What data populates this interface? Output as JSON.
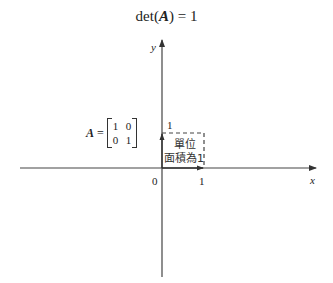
{
  "title": {
    "prefix": "det(",
    "symbol": "A",
    "suffix": ") = 1"
  },
  "axes": {
    "x_label": "x",
    "y_label": "y",
    "origin_label": "0",
    "x_tick_label": "1",
    "y_tick_label": "1"
  },
  "matrix": {
    "name": "A",
    "equals": "=",
    "rows": [
      [
        "1",
        "0"
      ],
      [
        "0",
        "1"
      ]
    ]
  },
  "annotation": {
    "line1": "單位",
    "line2": "面積為1"
  },
  "colors": {
    "axis": "#444444",
    "dashed_box": "#444444",
    "text": "#222222"
  }
}
